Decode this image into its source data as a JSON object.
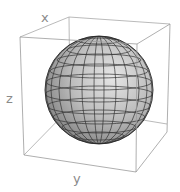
{
  "figure": {
    "type": "3d-surface-plot",
    "object": "sphere",
    "axis_labels": {
      "x": "x",
      "y": "y",
      "z": "z"
    },
    "colors": {
      "box": "#9a9a9a",
      "mesh": "#3a3a3a",
      "sphere_light": "#e2e2e2",
      "sphere_mid": "#b4b4b4",
      "sphere_dark": "#555555",
      "label": "#8a8a8a"
    },
    "mesh": {
      "latitude_lines": 11,
      "longitude_lines": 14
    }
  }
}
